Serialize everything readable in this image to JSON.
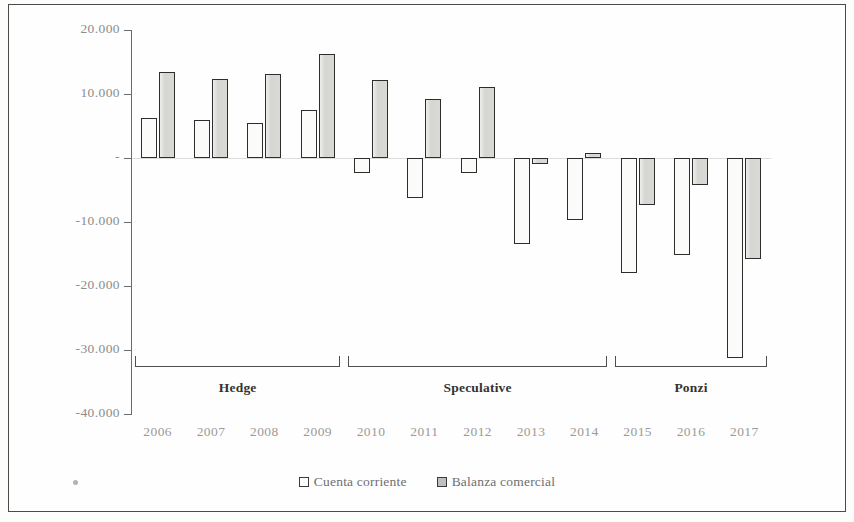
{
  "chart_data": {
    "type": "bar",
    "title": "",
    "subtitle": "",
    "xlabel": "",
    "ylabel": "",
    "categories": [
      "2006",
      "2007",
      "2008",
      "2009",
      "2010",
      "2011",
      "2012",
      "2013",
      "2014",
      "2015",
      "2016",
      "2017"
    ],
    "series": [
      {
        "name": "Cuenta corriente",
        "color": "#fbfbfa",
        "values": [
          6200,
          5900,
          5500,
          7500,
          -2300,
          -6200,
          -2400,
          -13500,
          -9700,
          -17900,
          -15200,
          -31200
        ]
      },
      {
        "name": "Balanza comercial",
        "color": "#d9d9d6",
        "values": [
          13400,
          12300,
          13100,
          16300,
          12200,
          9200,
          11100,
          -900,
          800,
          -7300,
          -4200,
          -15800
        ]
      }
    ],
    "ylim": [
      -40000,
      20000
    ],
    "ytick_values": [
      20000,
      10000,
      0,
      -10000,
      -20000,
      -30000,
      -40000
    ],
    "ytick_labels": [
      "20.000",
      "10.000",
      "-",
      "-10.000",
      "-20.000",
      "-30.000",
      "-40.000"
    ],
    "grid": false,
    "legend_position": "bottom",
    "annotations": [
      {
        "label": "Hedge",
        "start_category": "2006",
        "end_category": "2009"
      },
      {
        "label": "Speculative",
        "start_category": "2010",
        "end_category": "2014"
      },
      {
        "label": "Ponzi",
        "start_category": "2015",
        "end_category": "2017"
      }
    ]
  },
  "legend": {
    "items": [
      {
        "label": "Cuenta corriente",
        "swatch": "cc"
      },
      {
        "label": "Balanza comercial",
        "swatch": "bc"
      }
    ]
  },
  "periods": [
    {
      "label": "Hedge"
    },
    {
      "label": "Speculative"
    },
    {
      "label": "Ponzi"
    }
  ],
  "axis": {
    "y_labels": [
      "20.000",
      "10.000",
      "-",
      "-10.000",
      "-20.000",
      "-30.000",
      "-40.000"
    ],
    "x_labels": [
      "2006",
      "2007",
      "2008",
      "2009",
      "2010",
      "2011",
      "2012",
      "2013",
      "2014",
      "2015",
      "2016",
      "2017"
    ]
  }
}
